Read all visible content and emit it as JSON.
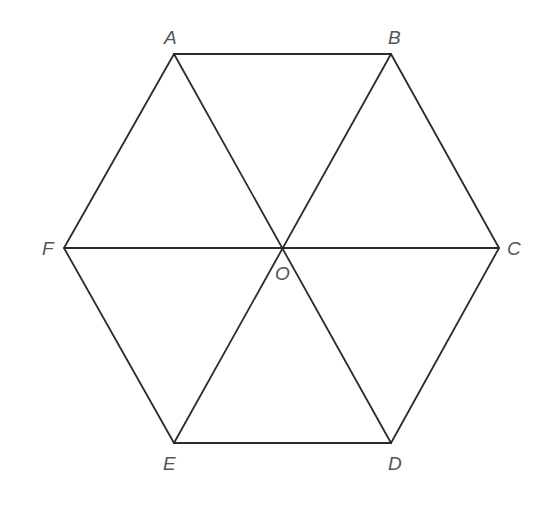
{
  "figure": {
    "type": "regular-hexagon",
    "line_color": "#2b2b2b",
    "label_color": "#555555",
    "vertices": {
      "A": {
        "label": "A",
        "x": 174,
        "y": 54
      },
      "B": {
        "label": "B",
        "x": 391,
        "y": 54
      },
      "C": {
        "label": "C",
        "x": 499,
        "y": 248
      },
      "D": {
        "label": "D",
        "x": 391,
        "y": 443
      },
      "E": {
        "label": "E",
        "x": 174,
        "y": 443
      },
      "F": {
        "label": "F",
        "x": 64,
        "y": 248
      },
      "O": {
        "label": "O",
        "x": 284,
        "y": 248
      }
    },
    "sides": [
      "AB",
      "BC",
      "CD",
      "DE",
      "EF",
      "FA"
    ],
    "diagonals": [
      "AD",
      "BE",
      "CF"
    ]
  }
}
